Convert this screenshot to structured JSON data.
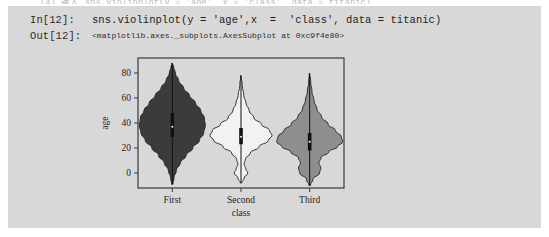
{
  "notebook": {
    "ghost_text": "(4) 输入 sns.violinplot(y = 'age', x = 'class', data = titanic)",
    "in_prompt": "In[12]:",
    "out_prompt": "Out[12]:",
    "code": "sns.violinplot(y = 'age',x  =  'class', data = titanic)",
    "output": "<matplotlib.axes._subplots.AxesSubplot at 0xc9f4e80>",
    "cell_bg": "#d8d8d8"
  },
  "chart_data": {
    "type": "violin",
    "title": "",
    "xlabel": "class",
    "ylabel": "age",
    "categories": [
      "First",
      "Second",
      "Third"
    ],
    "ylim": [
      -12,
      92
    ],
    "yticks": [
      0,
      20,
      40,
      60,
      80
    ],
    "ytick_labels": [
      "0",
      "20",
      "40",
      "60",
      "80"
    ],
    "grid": false,
    "legend": false,
    "plot_bg": "#d8d8d8",
    "axes_color": "#3a3a3a",
    "series": [
      {
        "name": "First",
        "fill": "#3b3b3b",
        "edge": "#222222",
        "median": 37,
        "q1": 29,
        "q3": 48,
        "whisker_low": -9,
        "whisker_high": 88,
        "max_width": 33,
        "density": [
          {
            "y": -9,
            "w": 0.02
          },
          {
            "y": -4,
            "w": 0.05
          },
          {
            "y": 2,
            "w": 0.12
          },
          {
            "y": 8,
            "w": 0.24
          },
          {
            "y": 14,
            "w": 0.42
          },
          {
            "y": 20,
            "w": 0.62
          },
          {
            "y": 26,
            "w": 0.82
          },
          {
            "y": 32,
            "w": 0.95
          },
          {
            "y": 38,
            "w": 1.0
          },
          {
            "y": 44,
            "w": 0.97
          },
          {
            "y": 50,
            "w": 0.86
          },
          {
            "y": 56,
            "w": 0.7
          },
          {
            "y": 62,
            "w": 0.52
          },
          {
            "y": 68,
            "w": 0.34
          },
          {
            "y": 74,
            "w": 0.19
          },
          {
            "y": 80,
            "w": 0.09
          },
          {
            "y": 85,
            "w": 0.04
          },
          {
            "y": 88,
            "w": 0.01
          }
        ]
      },
      {
        "name": "Second",
        "fill": "#f2f2f2",
        "edge": "#222222",
        "median": 29,
        "q1": 23,
        "q3": 36,
        "whisker_low": -8,
        "whisker_high": 78,
        "max_width": 31,
        "density": [
          {
            "y": -8,
            "w": 0.02
          },
          {
            "y": -4,
            "w": 0.1
          },
          {
            "y": 0,
            "w": 0.22
          },
          {
            "y": 3,
            "w": 0.16
          },
          {
            "y": 7,
            "w": 0.1
          },
          {
            "y": 11,
            "w": 0.14
          },
          {
            "y": 16,
            "w": 0.3
          },
          {
            "y": 21,
            "w": 0.58
          },
          {
            "y": 26,
            "w": 0.88
          },
          {
            "y": 30,
            "w": 1.0
          },
          {
            "y": 34,
            "w": 0.92
          },
          {
            "y": 39,
            "w": 0.66
          },
          {
            "y": 44,
            "w": 0.42
          },
          {
            "y": 50,
            "w": 0.26
          },
          {
            "y": 56,
            "w": 0.16
          },
          {
            "y": 62,
            "w": 0.09
          },
          {
            "y": 70,
            "w": 0.04
          },
          {
            "y": 78,
            "w": 0.01
          }
        ]
      },
      {
        "name": "Third",
        "fill": "#8e8e8e",
        "edge": "#222222",
        "median": 25,
        "q1": 18,
        "q3": 32,
        "whisker_low": -10,
        "whisker_high": 80,
        "max_width": 33,
        "density": [
          {
            "y": -10,
            "w": 0.02
          },
          {
            "y": -5,
            "w": 0.1
          },
          {
            "y": 0,
            "w": 0.3
          },
          {
            "y": 4,
            "w": 0.34
          },
          {
            "y": 8,
            "w": 0.28
          },
          {
            "y": 12,
            "w": 0.34
          },
          {
            "y": 17,
            "w": 0.58
          },
          {
            "y": 21,
            "w": 0.84
          },
          {
            "y": 25,
            "w": 1.0
          },
          {
            "y": 29,
            "w": 0.96
          },
          {
            "y": 34,
            "w": 0.78
          },
          {
            "y": 39,
            "w": 0.56
          },
          {
            "y": 45,
            "w": 0.36
          },
          {
            "y": 51,
            "w": 0.22
          },
          {
            "y": 58,
            "w": 0.13
          },
          {
            "y": 65,
            "w": 0.07
          },
          {
            "y": 73,
            "w": 0.03
          },
          {
            "y": 80,
            "w": 0.01
          }
        ]
      }
    ]
  }
}
